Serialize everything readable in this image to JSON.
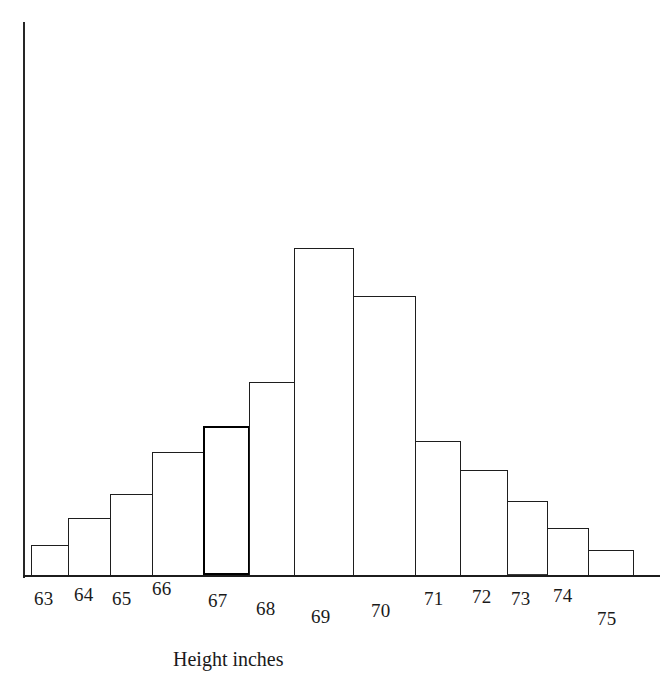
{
  "chart_data": {
    "type": "bar",
    "title": "",
    "subtitle": "",
    "xlabel": "Height inches",
    "ylabel": "",
    "categories": [
      "63",
      "64",
      "65",
      "66",
      "67",
      "68",
      "69",
      "70",
      "71",
      "72",
      "73",
      "74",
      "75"
    ],
    "values": [
      31,
      58,
      82,
      124,
      150,
      194,
      328,
      280,
      135,
      106,
      75,
      48,
      26
    ],
    "value_unit": "frequency (arbitrary axis units, unlabeled)",
    "xlim": [
      62.5,
      75.5
    ],
    "ylim": [
      0,
      554
    ],
    "grid": false,
    "legend": null,
    "axis_style": {
      "y_axis_visible": true,
      "y_axis_ticks": false,
      "y_axis_tick_labels": false,
      "x_axis_visible": true,
      "x_axis_ticks": false,
      "bars_outlined": true,
      "bar_fill": "#ffffff",
      "bar_outline_color": "#1e1e1e"
    }
  },
  "colors": {
    "background": "#ffffff",
    "ink": "#1a1a1a",
    "axis": "#262626",
    "bar_outline": "#1e1e1e"
  },
  "axis": {
    "x_title": "Height inches"
  },
  "bars": [
    {
      "label": "63",
      "value": 31,
      "x": 31,
      "w": 38,
      "top": 545,
      "style": "normal"
    },
    {
      "label": "64",
      "value": 58,
      "x": 68,
      "w": 43,
      "top": 518,
      "style": "normal"
    },
    {
      "label": "65",
      "value": 82,
      "x": 110,
      "w": 43,
      "top": 494,
      "style": "normal"
    },
    {
      "label": "66",
      "value": 124,
      "x": 152,
      "w": 52,
      "top": 452,
      "style": "normal"
    },
    {
      "label": "67",
      "value": 150,
      "x": 203,
      "w": 47,
      "top": 426,
      "style": "heavy"
    },
    {
      "label": "68",
      "value": 194,
      "x": 249,
      "w": 48,
      "top": 382,
      "style": "normal"
    },
    {
      "label": "69",
      "value": 328,
      "x": 294,
      "w": 60,
      "top": 248,
      "style": "normal"
    },
    {
      "label": "70",
      "value": 280,
      "x": 353,
      "w": 63,
      "top": 296,
      "style": "normal"
    },
    {
      "label": "71",
      "value": 135,
      "x": 415,
      "w": 46,
      "top": 441,
      "style": "normal"
    },
    {
      "label": "72",
      "value": 106,
      "x": 460,
      "w": 48,
      "top": 470,
      "style": "normal"
    },
    {
      "label": "73",
      "value": 75,
      "x": 507,
      "w": 41,
      "top": 501,
      "style": "double-base"
    },
    {
      "label": "74",
      "value": 48,
      "x": 547,
      "w": 42,
      "top": 528,
      "style": "normal"
    },
    {
      "label": "75",
      "value": 26,
      "x": 588,
      "w": 46,
      "top": 550,
      "style": "normal"
    }
  ],
  "tick_labels": [
    {
      "text": "63",
      "x": 34,
      "y": 588
    },
    {
      "text": "64",
      "x": 74,
      "y": 584
    },
    {
      "text": "65",
      "x": 112,
      "y": 588
    },
    {
      "text": "66",
      "x": 152,
      "y": 578
    },
    {
      "text": "67",
      "x": 208,
      "y": 590
    },
    {
      "text": "68",
      "x": 256,
      "y": 598
    },
    {
      "text": "69",
      "x": 311,
      "y": 606
    },
    {
      "text": "70",
      "x": 371,
      "y": 600
    },
    {
      "text": "71",
      "x": 424,
      "y": 588
    },
    {
      "text": "72",
      "x": 472,
      "y": 586
    },
    {
      "text": "73",
      "x": 511,
      "y": 588
    },
    {
      "text": "74",
      "x": 553,
      "y": 585
    },
    {
      "text": "75",
      "x": 597,
      "y": 608
    }
  ],
  "axis_title_pos": {
    "x": 173,
    "y": 648
  },
  "geometry": {
    "y_axis": {
      "x": 23,
      "top": 22,
      "bottom": 578,
      "width": 2
    },
    "x_axis": {
      "x": 23,
      "y": 575,
      "width": 637,
      "height": 2
    }
  }
}
